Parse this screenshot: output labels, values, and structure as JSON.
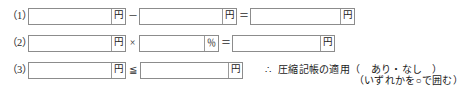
{
  "form": {
    "rows": [
      {
        "label": "（1）",
        "fields": [
          {
            "name": "amount-1",
            "value": "",
            "unit": "円"
          },
          {
            "name": "amount-2",
            "value": "",
            "unit": "円"
          },
          {
            "name": "amount-3",
            "value": "",
            "unit": "円"
          }
        ],
        "operators": [
          "－",
          "＝"
        ]
      },
      {
        "label": "（2）",
        "fields": [
          {
            "name": "amount-4",
            "value": "",
            "unit": "円"
          },
          {
            "name": "rate-1",
            "value": "",
            "unit": "％"
          },
          {
            "name": "amount-5",
            "value": "",
            "unit": "円"
          }
        ],
        "operators": [
          "×",
          "＝"
        ]
      },
      {
        "label": "（3）",
        "fields": [
          {
            "name": "amount-6",
            "value": "",
            "unit": "円"
          },
          {
            "name": "amount-7",
            "value": "",
            "unit": "円"
          }
        ],
        "operators": [
          "≦"
        ]
      }
    ],
    "conclusion": {
      "therefore_symbol": "∴",
      "text": "圧縮記帳の適用（　あり・なし　）"
    },
    "note": "（いずれかを○で囲む）"
  }
}
